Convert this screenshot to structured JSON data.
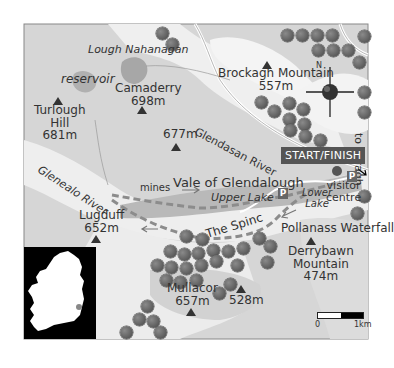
{
  "map": {
    "title": "Glendalough walk map",
    "labels": {
      "lough_nahanagan": "Lough Nahanagan",
      "reservoir": "reservoir",
      "turlough_hill": "Turlough\nHill",
      "turlough_hill_name1": "Turlough",
      "turlough_hill_name2": "Hill",
      "turlough_hill_height": "681m",
      "camaderry": "Camaderry",
      "camaderry_height": "698m",
      "unnamed_677": "677m",
      "brockagh": "Brockagh Mountain",
      "brockagh_height": "557m",
      "glendasan_river": "Glendasan River",
      "to_laragh": "to Laragh",
      "start_finish": "START/FINISH",
      "gleneald_river": "Glenealo River",
      "mines": "mines",
      "vale": "Vale of Glendalough",
      "upper_lake": "Upper Lake",
      "lower_lake_1": "Lower",
      "lower_lake_2": "Lake",
      "visitor_1": "visitor",
      "visitor_2": "centre",
      "parking": "P",
      "lugduff": "Lugduff",
      "lugduff_height": "652m",
      "the_spinc": "The Spinc",
      "pollanass": "Pollanass Waterfall",
      "derrybawn_1": "Derrybawn",
      "derrybawn_2": "Mountain",
      "derrybawn_height": "474m",
      "mullacor": "Mullacor",
      "mullacor_height": "657m",
      "unnamed_528": "528m"
    },
    "compass": {
      "north_label": "N"
    },
    "scale": {
      "start": "0",
      "end": "1km"
    },
    "colors": {
      "land_grey": "#d9d9d9",
      "valley_light": "#f0f0f0",
      "lake": "#a9a9a9",
      "route": "#8c8c8c",
      "tree": "#6e6e6e",
      "badge": "#555555"
    }
  }
}
